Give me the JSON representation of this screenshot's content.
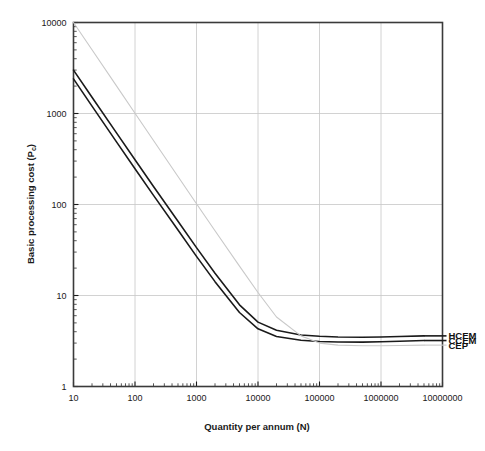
{
  "chart_data": {
    "type": "line",
    "title": "",
    "xlabel": "Quantity per annum (N)",
    "ylabel": "Basic processing cost (Pc)",
    "ylabel_text": "Basic processing cost (P",
    "ylabel_sub": "c",
    "ylabel_tail": ")",
    "xscale": "log",
    "yscale": "log",
    "xlim": [
      10,
      10000000
    ],
    "ylim": [
      1,
      10000
    ],
    "grid": true,
    "legend_position": "right-inline",
    "xticks": [
      10,
      100,
      1000,
      10000,
      100000,
      1000000,
      10000000
    ],
    "xtick_labels": [
      "10",
      "100",
      "1000",
      "10000",
      "100000",
      "1000000",
      "10000000"
    ],
    "yticks": [
      1,
      10,
      100,
      1000,
      10000
    ],
    "ytick_labels": [
      "1",
      "10",
      "100",
      "1000",
      "10000"
    ],
    "series": [
      {
        "name": "HCEM",
        "color": "#1a1a1a",
        "width": 1.6,
        "x": [
          10,
          20,
          50,
          100,
          200,
          500,
          1000,
          2000,
          5000,
          10000,
          20000,
          50000,
          100000,
          200000,
          500000,
          1000000,
          2000000,
          5000000
        ],
        "values": [
          3000,
          1510,
          612,
          310,
          158,
          65.5,
          33.6,
          17.6,
          7.9,
          5.1,
          4.15,
          3.68,
          3.56,
          3.5,
          3.48,
          3.5,
          3.54,
          3.6
        ]
      },
      {
        "name": "CCEM",
        "color": "#1a1a1a",
        "width": 1.6,
        "x": [
          10,
          20,
          50,
          100,
          200,
          500,
          1000,
          2000,
          5000,
          10000,
          20000,
          50000,
          100000,
          200000,
          500000,
          1000000,
          2000000,
          5000000
        ],
        "values": [
          2400,
          1205,
          488,
          247,
          126,
          52.4,
          26.9,
          14.2,
          6.5,
          4.3,
          3.55,
          3.22,
          3.12,
          3.08,
          3.07,
          3.1,
          3.14,
          3.2
        ]
      },
      {
        "name": "CEP",
        "color": "#c9c9c9",
        "width": 1.1,
        "x": [
          10,
          20,
          50,
          100,
          200,
          500,
          1000,
          2000,
          5000,
          10000,
          20000,
          50000,
          100000,
          200000,
          500000,
          1000000,
          2000000,
          5000000
        ],
        "values": [
          10000,
          5010,
          2010,
          1005,
          505,
          203,
          102,
          51.5,
          21.0,
          10.8,
          5.8,
          3.6,
          3.0,
          2.85,
          2.8,
          2.8,
          2.82,
          2.85
        ]
      }
    ],
    "annotations": [
      {
        "label": "HCEM",
        "x": 5000000,
        "y": 3.6
      },
      {
        "label": "CCEM",
        "x": 5000000,
        "y": 3.2
      },
      {
        "label": "CEP",
        "x": 5000000,
        "y": 2.85
      }
    ]
  }
}
